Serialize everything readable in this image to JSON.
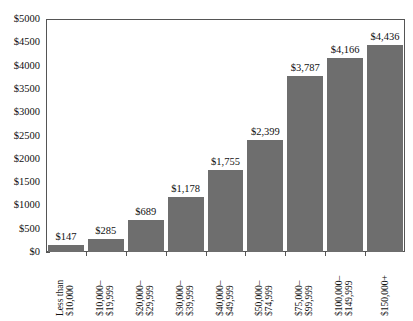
{
  "chart_data": {
    "type": "bar",
    "title": "",
    "subtitle": "",
    "xlabel": "",
    "ylabel": "",
    "categories": [
      "Less than $10,000",
      "$10,000–$19,999",
      "$20,000–$29,999",
      "$30,000–$39,999",
      "$40,000–$49,999",
      "$50,000–$74,999",
      "$75,000–$99,999",
      "$100,000–$149,999",
      "$150,000+"
    ],
    "category_lines": [
      [
        "Less than",
        "$10,000"
      ],
      [
        "$10,000–",
        "$19,999"
      ],
      [
        "$20,000–",
        "$29,999"
      ],
      [
        "$30,000–",
        "$39,999"
      ],
      [
        "$40,000–",
        "$49,999"
      ],
      [
        "$50,000–",
        "$74,999"
      ],
      [
        "$75,000–",
        "$99,999"
      ],
      [
        "$100,000–",
        "$149,999"
      ],
      [
        "$150,000+",
        ""
      ]
    ],
    "values": [
      147,
      285,
      689,
      1178,
      1755,
      2399,
      3787,
      4166,
      4436
    ],
    "value_labels": [
      "$147",
      "$285",
      "$689",
      "$1,178",
      "$1,755",
      "$2,399",
      "$3,787",
      "$4,166",
      "$4,436"
    ],
    "ylim": [
      0,
      5000
    ],
    "ytick_values": [
      0,
      500,
      1000,
      1500,
      2000,
      2500,
      3000,
      3500,
      4000,
      4500,
      5000
    ],
    "ytick_labels": [
      "$0",
      "$500",
      "$1000",
      "$1500",
      "$2000",
      "$2500",
      "$3000",
      "$3500",
      "$4000",
      "$4500",
      "$5000"
    ],
    "grid": false,
    "legend": false,
    "legend_position": "none",
    "bar_color": "#6e6e6e",
    "axis_color": "#555555",
    "background_color": "#ffffff"
  }
}
